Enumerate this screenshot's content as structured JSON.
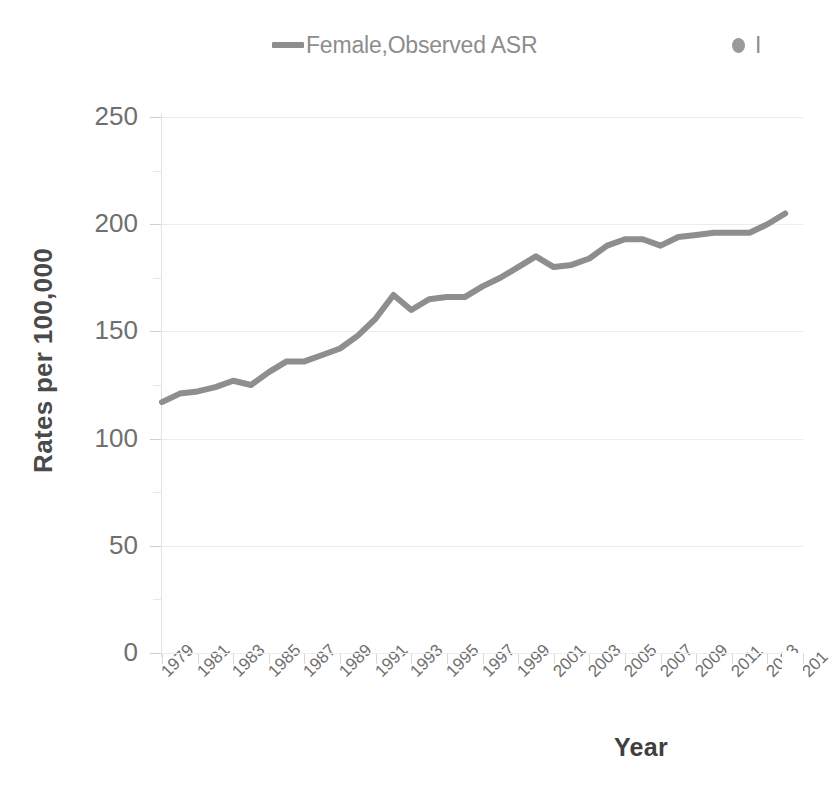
{
  "legend": {
    "position": "top",
    "entries": [
      {
        "label": "Female,Observed ASR",
        "marker": "line",
        "color": "#8e8e8e"
      },
      {
        "label": "I",
        "marker": "dot",
        "color": "#9a9a9a",
        "clipped": true
      }
    ]
  },
  "axes": {
    "y_title": "Rates per 100,000",
    "x_title": "Year",
    "y_ticks": [
      "0",
      "50",
      "100",
      "150",
      "200",
      "250"
    ],
    "x_ticks": [
      "1979",
      "1981",
      "1983",
      "1985",
      "1987",
      "1989",
      "1991",
      "1993",
      "1995",
      "1997",
      "1999",
      "2001",
      "2003",
      "2005",
      "2007",
      "2009",
      "2011",
      "2013",
      "201"
    ]
  },
  "colors": {
    "series_line": "#8e8e8e",
    "gridline": "#ececec",
    "axis_text": "#6f6f6f",
    "axis_title": "#434343",
    "background": "#ffffff"
  },
  "chart_data": {
    "type": "line",
    "title": "",
    "xlabel": "Year",
    "ylabel": "Rates per 100,000",
    "xlim": [
      1979,
      2015
    ],
    "ylim": [
      0,
      250
    ],
    "grid": true,
    "legend_position": "top",
    "x": [
      1979,
      1980,
      1981,
      1982,
      1983,
      1984,
      1985,
      1986,
      1987,
      1988,
      1989,
      1990,
      1991,
      1992,
      1993,
      1994,
      1995,
      1996,
      1997,
      1998,
      1999,
      2000,
      2001,
      2002,
      2003,
      2004,
      2005,
      2006,
      2007,
      2008,
      2009,
      2010,
      2011,
      2012,
      2013,
      2014
    ],
    "series": [
      {
        "name": "Female,Observed ASR",
        "color": "#8e8e8e",
        "values": [
          117,
          121,
          122,
          124,
          127,
          125,
          131,
          136,
          136,
          139,
          142,
          148,
          156,
          167,
          160,
          165,
          166,
          166,
          171,
          175,
          180,
          185,
          180,
          181,
          184,
          190,
          193,
          193,
          190,
          194,
          195,
          196,
          196,
          196,
          200,
          205
        ]
      }
    ]
  }
}
